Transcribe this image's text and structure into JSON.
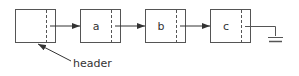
{
  "diagram": {
    "type": "linked-list",
    "colors": {
      "stroke": "#555555",
      "text": "#333333",
      "background": "#ffffff"
    },
    "nodes": [
      {
        "id": "header",
        "label": ""
      },
      {
        "id": "a",
        "label": "a"
      },
      {
        "id": "b",
        "label": "b"
      },
      {
        "id": "c",
        "label": "c"
      }
    ],
    "pointer_label": "header",
    "terminator": "ground-icon"
  }
}
